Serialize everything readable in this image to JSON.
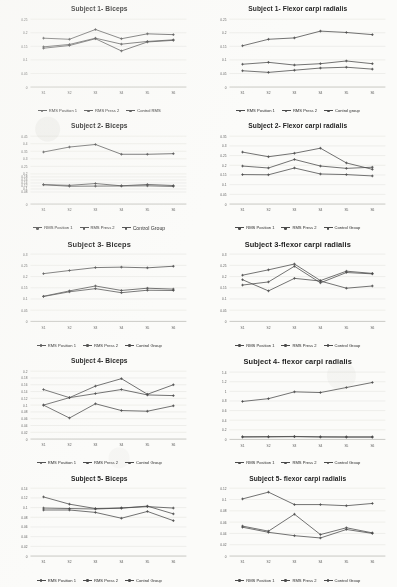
{
  "figure": {
    "background": "#fbfbf9",
    "line_color": "#4a4a4a",
    "grid_color": "#d8d8d2",
    "axis_color": "#9a9a94"
  },
  "series_names": {
    "s1": "RMS Position 1",
    "s2": "RMS Press 2",
    "s3": "Control Group"
  },
  "charts": [
    {
      "id": "subject-1-biceps",
      "title": "Subject 1- Biceps",
      "title_size": "small",
      "legend": [
        "RMS Position 1",
        "RMS Press 2",
        "Control RMS"
      ],
      "chart_data": {
        "type": "line",
        "title": "Subject 1- Biceps",
        "xlabel": "",
        "ylabel": "",
        "categories": [
          "S1",
          "S2",
          "S3",
          "S4",
          "S5",
          "S6"
        ],
        "ticks": [
          0,
          0.05,
          0.1,
          0.15,
          0.2,
          0.25
        ],
        "ylim": [
          0,
          0.25
        ],
        "grid": true,
        "legend_position": "bottom",
        "series": [
          {
            "name": "RMS Position 1",
            "values": [
              0.143,
              0.153,
              0.178,
              0.133,
              0.166,
              0.172
            ]
          },
          {
            "name": "RMS Press 2",
            "values": [
              0.148,
              0.157,
              0.18,
              0.158,
              0.168,
              0.174
            ]
          },
          {
            "name": "Control RMS",
            "values": [
              0.18,
              0.176,
              0.212,
              0.178,
              0.196,
              0.193
            ]
          }
        ]
      }
    },
    {
      "id": "subject-1-flexor",
      "title": "Subject 1- Flexor carpi radialis",
      "title_size": "small",
      "legend": [
        "RMS Position 1",
        "RMS Press 2",
        "Control group"
      ],
      "chart_data": {
        "type": "line",
        "title": "Subject 1- Flexor carpi radialis",
        "xlabel": "",
        "ylabel": "",
        "categories": [
          "S1",
          "S2",
          "S3",
          "S4",
          "S5",
          "S6"
        ],
        "ticks": [
          0,
          0.05,
          0.1,
          0.15,
          0.2,
          0.25
        ],
        "ylim": [
          0,
          0.25
        ],
        "grid": true,
        "legend_position": "bottom",
        "series": [
          {
            "name": "RMS Position 1",
            "values": [
              0.06,
              0.054,
              0.062,
              0.07,
              0.073,
              0.066
            ]
          },
          {
            "name": "RMS Press 2",
            "values": [
              0.084,
              0.091,
              0.081,
              0.086,
              0.096,
              0.086
            ]
          },
          {
            "name": "Control group",
            "values": [
              0.152,
              0.176,
              0.181,
              0.206,
              0.201,
              0.193
            ]
          }
        ]
      }
    },
    {
      "id": "subject-2-biceps",
      "title": "Subject 2- Biceps",
      "title_size": "small",
      "legend": [
        "RMS Position 1",
        "RMS Press 2",
        "Control Group"
      ],
      "legend_emphasis": 2,
      "chart_data": {
        "type": "line",
        "title": "Subject 2- Biceps",
        "xlabel": "",
        "ylabel": "",
        "categories": [
          "S1",
          "S2",
          "S3",
          "S4",
          "S5",
          "S6"
        ],
        "ticks": [
          0,
          0.08,
          0.1,
          0.12,
          0.14,
          0.16,
          0.18,
          0.2,
          0.25,
          0.3,
          0.35,
          0.4,
          0.45
        ],
        "ylim": [
          0,
          0.45
        ],
        "grid": true,
        "legend_position": "bottom",
        "series": [
          {
            "name": "RMS Position 1",
            "values": [
              0.128,
              0.118,
              0.119,
              0.12,
              0.121,
              0.117
            ]
          },
          {
            "name": "RMS Press 2",
            "values": [
              0.129,
              0.124,
              0.136,
              0.121,
              0.13,
              0.123
            ]
          },
          {
            "name": "Control Group",
            "values": [
              0.345,
              0.378,
              0.395,
              0.33,
              0.33,
              0.334
            ]
          }
        ]
      }
    },
    {
      "id": "subject-2-flexor",
      "title": "Subject 2- Flexor carpi radialis",
      "title_size": "small",
      "legend": [
        "RMS Position 1",
        "RMS Press 2",
        "Control Group"
      ],
      "chart_data": {
        "type": "line",
        "title": "Subject 2- Flexor carpi radialis",
        "xlabel": "",
        "ylabel": "",
        "categories": [
          "S1",
          "S2",
          "S3",
          "S4",
          "S5",
          "S6"
        ],
        "ticks": [
          0,
          0.05,
          0.1,
          0.15,
          0.2,
          0.25,
          0.3,
          0.35
        ],
        "ylim": [
          0,
          0.35
        ],
        "grid": true,
        "legend_position": "bottom",
        "series": [
          {
            "name": "RMS Position 1",
            "values": [
              0.152,
              0.151,
              0.186,
              0.155,
              0.152,
              0.145
            ]
          },
          {
            "name": "RMS Press 2",
            "values": [
              0.196,
              0.186,
              0.23,
              0.196,
              0.184,
              0.19
            ]
          },
          {
            "name": "Control Group",
            "values": [
              0.268,
              0.244,
              0.262,
              0.288,
              0.212,
              0.179
            ]
          }
        ]
      }
    },
    {
      "id": "subject-3-biceps",
      "title": "Subject 3- Biceps",
      "title_size": "big",
      "legend": [
        "RMS Position 1",
        "RMS Press 2",
        "Control Group"
      ],
      "chart_data": {
        "type": "line",
        "title": "Subject 3- Biceps",
        "xlabel": "",
        "ylabel": "",
        "categories": [
          "S1",
          "S2",
          "S3",
          "S4",
          "S5",
          "S6"
        ],
        "ticks": [
          0,
          0.05,
          0.1,
          0.15,
          0.2,
          0.25,
          0.3
        ],
        "ylim": [
          0,
          0.3
        ],
        "grid": true,
        "legend_position": "bottom",
        "series": [
          {
            "name": "RMS Position 1",
            "values": [
              0.111,
              0.132,
              0.146,
              0.128,
              0.139,
              0.138
            ]
          },
          {
            "name": "RMS Press 2",
            "values": [
              0.112,
              0.136,
              0.158,
              0.138,
              0.148,
              0.144
            ]
          },
          {
            "name": "Control Group",
            "values": [
              0.213,
              0.227,
              0.24,
              0.242,
              0.239,
              0.246
            ]
          }
        ]
      }
    },
    {
      "id": "subject-3-flexor",
      "title": "Subject 3-flexor carpi radialis",
      "title_size": "big",
      "legend": [
        "RMS Position 1",
        "RMS Press 2",
        "Control Group"
      ],
      "chart_data": {
        "type": "line",
        "title": "Subject 3-flexor carpi radialis",
        "xlabel": "",
        "ylabel": "",
        "categories": [
          "S1",
          "S2",
          "S3",
          "S4",
          "S5",
          "S6"
        ],
        "ticks": [
          0,
          0.05,
          0.1,
          0.15,
          0.2,
          0.25,
          0.3
        ],
        "ylim": [
          0,
          0.3
        ],
        "grid": true,
        "legend_position": "bottom",
        "series": [
          {
            "name": "RMS Position 1",
            "values": [
              0.162,
              0.176,
              0.246,
              0.172,
              0.218,
              0.212
            ]
          },
          {
            "name": "RMS Press 2",
            "values": [
              0.206,
              0.23,
              0.256,
              0.182,
              0.224,
              0.214
            ]
          },
          {
            "name": "Control Group",
            "values": [
              0.186,
              0.136,
              0.192,
              0.18,
              0.148,
              0.158
            ]
          }
        ]
      }
    },
    {
      "id": "subject-4-biceps",
      "title": "Subject 4- Biceps",
      "title_size": "small",
      "legend": [
        "RMS Position 1",
        "RMS Press 2",
        "Control Group"
      ],
      "chart_data": {
        "type": "line",
        "title": "Subject 4- Biceps",
        "xlabel": "",
        "ylabel": "",
        "categories": [
          "S1",
          "S2",
          "S3",
          "S4",
          "S5",
          "S6"
        ],
        "ticks": [
          0,
          0.02,
          0.04,
          0.06,
          0.08,
          0.1,
          0.12,
          0.14,
          0.16,
          0.18,
          0.2
        ],
        "ylim": [
          0,
          0.2
        ],
        "grid": true,
        "legend_position": "bottom",
        "series": [
          {
            "name": "RMS Position 1",
            "values": [
              0.146,
              0.122,
              0.134,
              0.146,
              0.13,
              0.128
            ]
          },
          {
            "name": "RMS Press 2",
            "values": [
              0.1,
              0.062,
              0.104,
              0.084,
              0.082,
              0.098
            ]
          },
          {
            "name": "Control Group",
            "values": [
              0.1,
              0.122,
              0.156,
              0.178,
              0.132,
              0.16
            ]
          }
        ]
      }
    },
    {
      "id": "subject-4-flexor",
      "title": "Subject 4- flexor carpi radialis",
      "title_size": "big",
      "legend": [
        "RMS Position 1",
        "RMS Press 2",
        "Control Group"
      ],
      "chart_data": {
        "type": "line",
        "title": "Subject 4- flexor carpi radialis",
        "xlabel": "",
        "ylabel": "",
        "categories": [
          "S1",
          "S2",
          "S3",
          "S4",
          "S5",
          "S6"
        ],
        "ticks": [
          0,
          0.2,
          0.4,
          0.6,
          0.8,
          1.0,
          1.2,
          1.4
        ],
        "ylim": [
          0,
          1.4
        ],
        "grid": true,
        "legend_position": "bottom",
        "series": [
          {
            "name": "RMS Position 1",
            "values": [
              0.055,
              0.058,
              0.062,
              0.054,
              0.052,
              0.052
            ]
          },
          {
            "name": "RMS Press 2",
            "values": [
              0.05,
              0.052,
              0.056,
              0.05,
              0.048,
              0.048
            ]
          },
          {
            "name": "Control Group",
            "values": [
              0.79,
              0.848,
              0.99,
              0.975,
              1.08,
              1.185
            ]
          }
        ]
      }
    },
    {
      "id": "subject-5-biceps",
      "title": "Subject 5- Biceps",
      "title_size": "small",
      "legend": [
        "RMS Position 1",
        "RMS Press 2",
        "Control Group"
      ],
      "chart_data": {
        "type": "line",
        "title": "Subject 5- Biceps",
        "xlabel": "",
        "ylabel": "",
        "categories": [
          "S1",
          "S2",
          "S3",
          "S4",
          "S5",
          "S6"
        ],
        "ticks": [
          0,
          0.02,
          0.04,
          0.06,
          0.08,
          0.1,
          0.12,
          0.14
        ],
        "ylim": [
          0,
          0.14
        ],
        "grid": true,
        "legend_position": "bottom",
        "series": [
          {
            "name": "RMS Position 1",
            "values": [
              0.095,
              0.095,
              0.09,
              0.078,
              0.092,
              0.073
            ]
          },
          {
            "name": "RMS Press 2",
            "values": [
              0.099,
              0.098,
              0.097,
              0.099,
              0.103,
              0.087
            ]
          },
          {
            "name": "Control Group",
            "values": [
              0.122,
              0.107,
              0.098,
              0.099,
              0.102,
              0.099
            ]
          }
        ]
      }
    },
    {
      "id": "subject-5-flexor",
      "title": "Subject 5- flexor carpi radialis",
      "title_size": "small",
      "legend": [
        "RMS Position 1",
        "RMS Press 2",
        "Control Group"
      ],
      "chart_data": {
        "type": "line",
        "title": "Subject 5- flexor carpi radialis",
        "xlabel": "",
        "ylabel": "",
        "categories": [
          "S1",
          "S2",
          "S3",
          "S4",
          "S5",
          "S6"
        ],
        "ticks": [
          0,
          0.02,
          0.04,
          0.06,
          0.08,
          0.1,
          0.12
        ],
        "ylim": [
          0,
          0.12
        ],
        "grid": true,
        "legend_position": "bottom",
        "series": [
          {
            "name": "RMS Position 1",
            "values": [
              0.051,
              0.042,
              0.036,
              0.032,
              0.047,
              0.04
            ]
          },
          {
            "name": "RMS Press 2",
            "values": [
              0.053,
              0.044,
              0.074,
              0.038,
              0.05,
              0.041
            ]
          },
          {
            "name": "Control Group",
            "values": [
              0.101,
              0.113,
              0.091,
              0.091,
              0.089,
              0.093
            ]
          }
        ]
      }
    }
  ]
}
